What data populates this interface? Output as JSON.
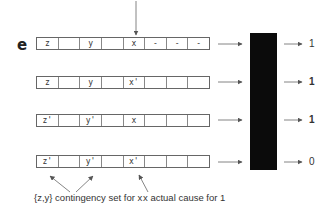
{
  "diagram": {
    "input_label": "e",
    "rows": [
      {
        "cells": [
          "z",
          "",
          "y",
          "",
          "x",
          "-",
          "-",
          "-"
        ],
        "output": "1"
      },
      {
        "cells": [
          "z",
          "",
          "y",
          "",
          "x'",
          "",
          "",
          ""
        ],
        "output": "1"
      },
      {
        "cells": [
          "z'",
          "",
          "y'",
          "",
          "x",
          "",
          "",
          ""
        ],
        "output": "1"
      },
      {
        "cells": [
          "z'",
          "",
          "y'",
          "",
          "x'",
          "",
          "",
          ""
        ],
        "output": "0"
      }
    ],
    "model_box": {
      "color": "#0b0b0b",
      "description": "black-box model"
    },
    "captions": {
      "contingency": "{z,y} contingency set for x",
      "actual_cause": "x  actual cause for 1"
    }
  }
}
